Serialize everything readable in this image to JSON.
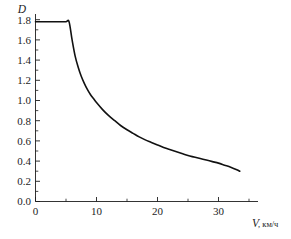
{
  "chart_data": {
    "type": "line",
    "title": "",
    "subtitle": "",
    "xlabel": "V, км/ч",
    "xlabel_symbol": "V",
    "xlabel_unit": ", км/ч",
    "ylabel": "D",
    "xlim": [
      0,
      36.5
    ],
    "ylim": [
      0.0,
      1.86
    ],
    "grid": false,
    "legend": null,
    "x_ticks": [
      0,
      10,
      20,
      30
    ],
    "x_tick_labels": [
      "0",
      "10",
      "20",
      "30"
    ],
    "x_minor_ticks": [
      5,
      15,
      25,
      35
    ],
    "y_ticks": [
      0.0,
      0.2,
      0.4,
      0.6,
      0.8,
      1.0,
      1.2,
      1.4,
      1.6,
      1.8
    ],
    "y_tick_labels": [
      "0.0",
      "0.2",
      "0.4",
      "0.6",
      "0.8",
      "1.0",
      "1.2",
      "1.4",
      "1.6",
      "1.8"
    ],
    "y_minor_ticks": [
      0.1,
      0.3,
      0.5,
      0.7,
      0.9,
      1.1,
      1.3,
      1.5,
      1.7
    ],
    "series": [
      {
        "name": "D(V)",
        "color": "#111111",
        "x": [
          0.0,
          1.0,
          2.0,
          3.0,
          4.0,
          5.0,
          5.5,
          6.0,
          6.5,
          7.0,
          7.5,
          8.0,
          8.5,
          9.0,
          9.5,
          10.0,
          11.0,
          12.0,
          13.0,
          14.0,
          15.0,
          16.0,
          17.0,
          18.0,
          19.0,
          20.0,
          21.0,
          22.0,
          23.0,
          24.0,
          25.0,
          26.0,
          27.0,
          28.0,
          29.0,
          30.0,
          31.0,
          32.0,
          33.0,
          33.5
        ],
        "y": [
          1.78,
          1.78,
          1.78,
          1.78,
          1.78,
          1.78,
          1.78,
          1.6,
          1.44,
          1.33,
          1.24,
          1.17,
          1.11,
          1.06,
          1.02,
          0.98,
          0.91,
          0.85,
          0.8,
          0.75,
          0.71,
          0.675,
          0.64,
          0.61,
          0.585,
          0.56,
          0.535,
          0.515,
          0.495,
          0.475,
          0.455,
          0.44,
          0.425,
          0.41,
          0.395,
          0.38,
          0.36,
          0.34,
          0.315,
          0.3
        ]
      }
    ],
    "annotations": [
      {
        "text": "flat saturation at D = 1.78 for V ≤ 5.5 км/ч"
      },
      {
        "text": "hyperbolic decay D ≈ 10/V beyond the knee"
      }
    ],
    "knee_point": {
      "x": 5.5,
      "y": 1.78
    },
    "end_point": {
      "x": 33.5,
      "y": 0.3
    }
  }
}
